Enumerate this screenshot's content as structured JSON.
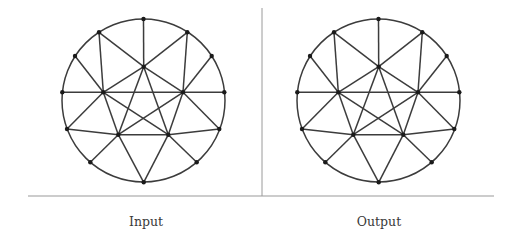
{
  "panels": [
    {
      "label": "Input",
      "center": [
        143.5,
        100.5
      ],
      "radius": 81.5
    },
    {
      "label": "Output",
      "center": [
        378.5,
        100.5
      ],
      "radius": 81.5
    }
  ],
  "graph": {
    "nodes": {
      "top": [
        0,
        -81.5
      ],
      "ul": [
        -44.5,
        -68.2
      ],
      "ur": [
        43.8,
        -68.2
      ],
      "lu": [
        -68.5,
        -44.5
      ],
      "ru": [
        68.2,
        -44.5
      ],
      "l": [
        -81.2,
        -8.2
      ],
      "r": [
        80.8,
        -8.2
      ],
      "ll": [
        -76.5,
        28.5
      ],
      "rl": [
        75.8,
        28.5
      ],
      "bl": [
        -53.2,
        61.8
      ],
      "br": [
        53.2,
        61.8
      ],
      "bottom": [
        0.2,
        81.8
      ],
      "ct": [
        0.2,
        -33.8
      ],
      "il": [
        -40.2,
        -8.2
      ],
      "ir": [
        39.5,
        -8.2
      ],
      "ibl": [
        -25.2,
        34.2
      ],
      "ibr": [
        24.8,
        34.2
      ]
    },
    "edges": [
      [
        "top",
        "ct"
      ],
      [
        "ul",
        "ct"
      ],
      [
        "ur",
        "ct"
      ],
      [
        "ul",
        "il"
      ],
      [
        "ur",
        "ir"
      ],
      [
        "lu",
        "il"
      ],
      [
        "ru",
        "ir"
      ],
      [
        "l",
        "il"
      ],
      [
        "il",
        "ir"
      ],
      [
        "ir",
        "r"
      ],
      [
        "ct",
        "il"
      ],
      [
        "ct",
        "ir"
      ],
      [
        "ct",
        "ibl"
      ],
      [
        "ct",
        "ibr"
      ],
      [
        "il",
        "ibl"
      ],
      [
        "il",
        "ibr"
      ],
      [
        "ir",
        "ibl"
      ],
      [
        "ir",
        "ibr"
      ],
      [
        "ll",
        "il"
      ],
      [
        "ll",
        "ibl"
      ],
      [
        "rl",
        "ir"
      ],
      [
        "rl",
        "ibr"
      ],
      [
        "ibl",
        "ibr"
      ],
      [
        "bl",
        "ibl"
      ],
      [
        "br",
        "ibr"
      ],
      [
        "bottom",
        "ibl"
      ],
      [
        "bottom",
        "ibr"
      ]
    ]
  },
  "dividers": {
    "vertical": {
      "x": 262,
      "y1": 8,
      "y2": 196
    },
    "horizontal": {
      "y": 196,
      "x1": 28,
      "x2": 494
    }
  },
  "colors": {
    "stroke": "#3c3c3c",
    "node": "#1a1a1a",
    "divider": "#9a9a9a",
    "text": "#3a3a3a"
  }
}
